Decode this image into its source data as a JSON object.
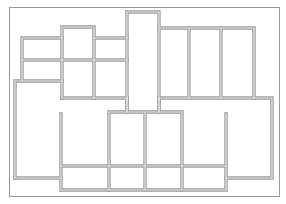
{
  "diagram": {
    "type": "floor-plan",
    "title": "",
    "colors": {
      "background": "#ffffff",
      "frame": "#9a9a9a",
      "wall_outer": "#9c9c9c",
      "wall_inner": "#e6e6e6"
    },
    "frame": {
      "x": 9,
      "y": 7,
      "w": 270,
      "h": 189
    },
    "walls": [
      {
        "id": "left-wing-top",
        "points": "15,178 15,81 62,81"
      },
      {
        "id": "left-wing-bottom",
        "points": "15,178 61,178"
      },
      {
        "id": "left-box",
        "points": "22,81 22,38 62,38"
      },
      {
        "id": "col-a",
        "points": "62,98 62,27 94,27 94,98"
      },
      {
        "id": "col-a-mid",
        "points": "22,60 127,60"
      },
      {
        "id": "col-a-top-right",
        "points": "94,38 127,38"
      },
      {
        "id": "col-b",
        "points": "62,98 127,98"
      },
      {
        "id": "tall-column",
        "points": "127,112 127,12 159,12 159,112"
      },
      {
        "id": "right-rooms-top",
        "points": "159,28 254,28 254,98"
      },
      {
        "id": "right-divider-1",
        "points": "189,28 189,98"
      },
      {
        "id": "right-divider-2",
        "points": "221,28 221,98"
      },
      {
        "id": "right-rooms-bottom",
        "points": "159,98 272,98 272,178 226,178"
      },
      {
        "id": "center-connector-1",
        "points": "127,98 127,112"
      },
      {
        "id": "center-connector-2",
        "points": "159,98 159,112"
      },
      {
        "id": "bottom-rooms",
        "points": "109,190 109,112 182,112 182,190"
      },
      {
        "id": "bottom-mid",
        "points": "145,112 145,190"
      },
      {
        "id": "bottom-left-stub",
        "points": "61,114 61,190 226,190 226,114"
      },
      {
        "id": "bottom-band",
        "points": "61,166 226,166"
      }
    ]
  }
}
